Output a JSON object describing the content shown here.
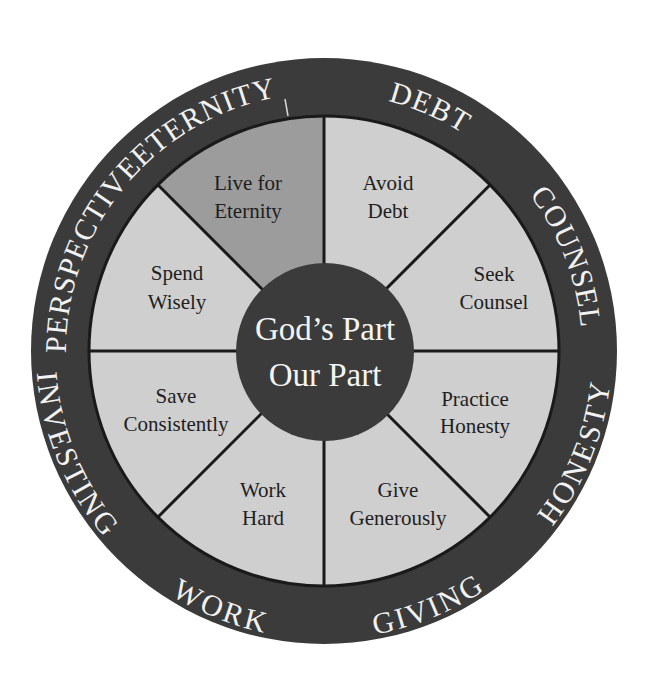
{
  "diagram": {
    "colors": {
      "outer_ring": "#3b3b3b",
      "sector_light": "#cfcfcf",
      "sector_highlight": "#9c9c9c",
      "hub": "#3b3b3b",
      "divider": "#1a1a1a",
      "ring_text": "#f2f2f2",
      "sector_text": "#1e1e1e"
    },
    "hub": {
      "line1": "God’s Part",
      "line2": "Our Part"
    },
    "ring_labels": {
      "eternity": "ETERNITY",
      "debt": "DEBT",
      "counsel": "COUNSEL",
      "honesty": "HONESTY",
      "giving": "GIVING",
      "work": "WORK",
      "investing": "INVESTING",
      "perspective": "PERSPECTIVE"
    },
    "sectors": {
      "eternity": {
        "line1": "Live for",
        "line2": "Eternity",
        "highlighted": true
      },
      "debt": {
        "line1": "Avoid",
        "line2": "Debt"
      },
      "counsel": {
        "line1": "Seek",
        "line2": "Counsel"
      },
      "honesty": {
        "line1": "Practice",
        "line2": "Honesty"
      },
      "giving": {
        "line1": "Give",
        "line2": "Generously"
      },
      "work": {
        "line1": "Work",
        "line2": "Hard"
      },
      "investing": {
        "line1": "Save",
        "line2": "Consistently"
      },
      "perspective": {
        "line1": "Spend",
        "line2": "Wisely"
      }
    }
  }
}
